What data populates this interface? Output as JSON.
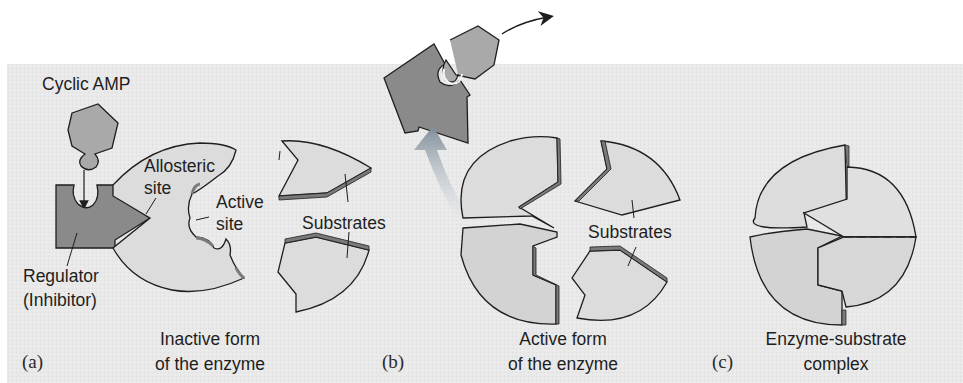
{
  "figure": {
    "colors": {
      "background_panel": "#e9e9e9",
      "page": "#ffffff",
      "enzyme_fill": "#dcdcdc",
      "enzyme_shade": "#cfcfcf",
      "regulator_fill": "#8a8a8a",
      "cyclic_amp_fill": "#a9a9a9",
      "edge_dark": "#7a7a7a",
      "stroke": "#1e1e1e",
      "arrow_gray": "#8d9aa6"
    },
    "panels": [
      {
        "id": "a",
        "marker": "(a)",
        "caption_line1": "Inactive form",
        "caption_line2": "of the enzyme",
        "labels": {
          "cyclic_amp": "Cyclic AMP",
          "allosteric_site_line1": "Allosteric",
          "allosteric_site_line2": "site",
          "active_site_line1": "Active",
          "active_site_line2": "site",
          "substrates": "Substrates",
          "regulator_line1": "Regulator",
          "regulator_line2": "(Inhibitor)"
        }
      },
      {
        "id": "b",
        "marker": "(b)",
        "caption_line1": "Active form",
        "caption_line2": "of the enzyme",
        "labels": {
          "substrates": "Substrates"
        }
      },
      {
        "id": "c",
        "marker": "(c)",
        "caption_line1": "Enzyme-substrate",
        "caption_line2": "complex"
      }
    ]
  }
}
